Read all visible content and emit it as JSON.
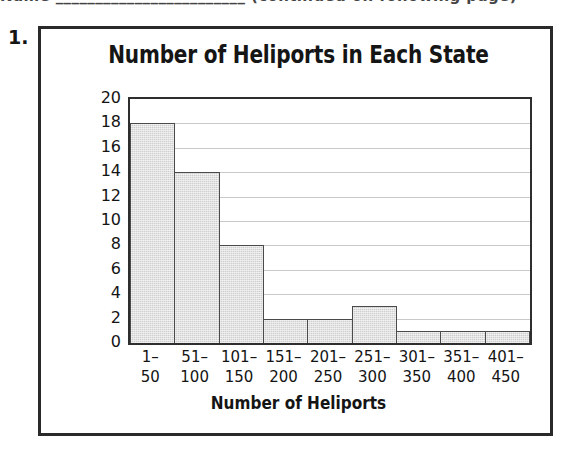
{
  "page": {
    "top_cutoff_text": "Name ________________________  (continued on following page)",
    "problem_number": "1."
  },
  "chart_data": {
    "type": "bar",
    "title": "Number of Heliports in Each State",
    "xlabel": "Number of Heliports",
    "ylabel": "Number of States",
    "categories": [
      "1–50",
      "51–100",
      "101–150",
      "151–200",
      "201–250",
      "251–300",
      "301–350",
      "351–400",
      "401–450"
    ],
    "category_lines": [
      [
        "1–",
        "50"
      ],
      [
        "51–",
        "100"
      ],
      [
        "101–",
        "150"
      ],
      [
        "151–",
        "200"
      ],
      [
        "201–",
        "250"
      ],
      [
        "251–",
        "300"
      ],
      [
        "301–",
        "350"
      ],
      [
        "351–",
        "400"
      ],
      [
        "401–",
        "450"
      ]
    ],
    "values": [
      18,
      14,
      8,
      2,
      2,
      3,
      1,
      1,
      1
    ],
    "ylim": [
      0,
      20
    ],
    "ytick_step": 2,
    "yticks": [
      20,
      18,
      16,
      14,
      12,
      10,
      8,
      6,
      4,
      2,
      0
    ],
    "grid": true,
    "legend": false,
    "bar_fill_color": "#cfcfcf",
    "bar_border_color": "#4a4a4a",
    "gridline_color": "#c9c9c9",
    "axis_color": "#2e2e2e"
  }
}
